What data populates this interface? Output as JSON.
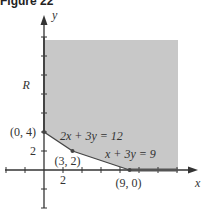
{
  "figure": {
    "title": "Figure 22"
  },
  "chart_data": {
    "type": "area",
    "title": "Figure 22",
    "xlabel": "x",
    "ylabel": "y",
    "xlim": [
      -4,
      16
    ],
    "ylim": [
      -4,
      16
    ],
    "x_tick_step": 2,
    "y_tick_step": 2,
    "x_tick_labels": [
      {
        "value": 2,
        "label": "2"
      }
    ],
    "y_tick_labels": [
      {
        "value": 2,
        "label": "2"
      }
    ],
    "region": {
      "label": "R",
      "label_at": [
        -1,
        9
      ],
      "description": "Feasible region bounded by y-axis, 2x + 3y = 12, x + 3y = 9 and x-axis; unbounded up and right",
      "boundary_vertices": [
        [
          0,
          14
        ],
        [
          0,
          4
        ],
        [
          3,
          2
        ],
        [
          9,
          0
        ],
        [
          14,
          0
        ],
        [
          14,
          14
        ]
      ],
      "fill_color": "#c8c8c8"
    },
    "lines": [
      {
        "equation": "2x + 3y = 12",
        "label": "2x + 3y = 12",
        "from": [
          0,
          4
        ],
        "to": [
          3,
          2
        ],
        "label_at": [
          1.8,
          3.0
        ]
      },
      {
        "equation": "x + 3y = 9",
        "label": "x + 3y = 9",
        "from": [
          3,
          2
        ],
        "to": [
          9,
          0
        ],
        "label_at": [
          6.7,
          1.0
        ]
      }
    ],
    "points": [
      {
        "x": 0,
        "y": 4,
        "label": "(0, 4)",
        "label_side": "left"
      },
      {
        "x": 3,
        "y": 2,
        "label": "(3, 2)",
        "label_side": "below"
      },
      {
        "x": 9,
        "y": 0,
        "label": "(9, 0)",
        "label_side": "below"
      }
    ],
    "colors": {
      "axis": "#333333",
      "boundary": "#444444",
      "region": "#c8c8c8"
    }
  }
}
